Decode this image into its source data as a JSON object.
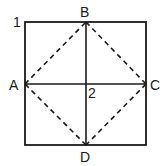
{
  "diagram": {
    "figure_label": "1",
    "center_label": "2",
    "colors": {
      "stroke": "#1a1a1a",
      "background": "#ffffff"
    },
    "square": {
      "x1": 25,
      "y1": 22,
      "x2": 146,
      "y2": 145
    },
    "points": {
      "A": {
        "label": "A",
        "x": 25,
        "y": 84
      },
      "B": {
        "label": "B",
        "x": 86,
        "y": 22
      },
      "C": {
        "label": "C",
        "x": 146,
        "y": 84
      },
      "D": {
        "label": "D",
        "x": 86,
        "y": 145
      }
    },
    "solid_lines": [
      {
        "from": "B",
        "to": "D"
      },
      {
        "from": "A",
        "to": "C"
      }
    ],
    "dashed_lines": [
      {
        "from": "A",
        "to": "B"
      },
      {
        "from": "B",
        "to": "C"
      },
      {
        "from": "C",
        "to": "D"
      },
      {
        "from": "D",
        "to": "A"
      }
    ]
  }
}
